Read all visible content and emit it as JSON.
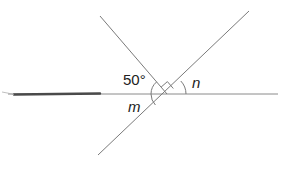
{
  "diagram": {
    "type": "intersecting-lines-angles",
    "labels": {
      "given_angle": "50°",
      "angle_m": "m",
      "angle_n": "n"
    },
    "markers": {
      "right_angle": "right-angle marker between upper-left and upper-right rays"
    },
    "colors": {
      "line": "#7a7a7a",
      "thick_stroke": "#4a4a4a",
      "text": "#222222",
      "background": "#ffffff"
    }
  }
}
